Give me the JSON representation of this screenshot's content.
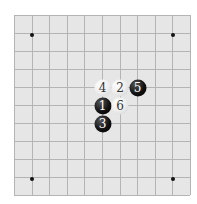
{
  "board": {
    "lines": 11,
    "origin": [
      14,
      15
    ],
    "spacing": [
      17.6,
      18
    ],
    "background": "#e6e6e6",
    "line_color": "#b4b4b4",
    "star_points": [
      [
        1,
        1
      ],
      [
        9,
        1
      ],
      [
        1,
        9
      ],
      [
        9,
        9
      ]
    ]
  },
  "stones": [
    {
      "number": "1",
      "color": "black",
      "col": 5,
      "row": 5
    },
    {
      "number": "2",
      "color": "white",
      "col": 6,
      "row": 4
    },
    {
      "number": "3",
      "color": "black",
      "col": 5,
      "row": 6
    },
    {
      "number": "4",
      "color": "white",
      "col": 5,
      "row": 4
    },
    {
      "number": "5",
      "color": "black",
      "col": 7,
      "row": 4
    },
    {
      "number": "6",
      "color": "white",
      "col": 6,
      "row": 5
    }
  ]
}
